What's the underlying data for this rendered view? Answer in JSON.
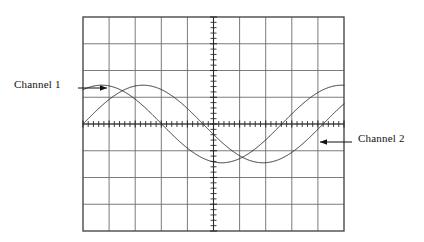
{
  "figure": {
    "kind": "oscilloscope-display",
    "background_color": "#ffffff"
  },
  "graticule": {
    "x": 83,
    "y": 17,
    "width": 261,
    "height": 214,
    "divisions_horizontal": 10,
    "divisions_vertical": 8,
    "subdivisions_per_division": 5,
    "grid_line_color": "#6d6d6d",
    "border_color": "#4a4a4a",
    "center_axis_color": "#2b2b2b",
    "tick_length_px": 6
  },
  "annotations": [
    {
      "id": "channel-1",
      "label": "Channel 1",
      "side": "left",
      "arrow_direction": "right",
      "text_x": 14,
      "text_y": 78,
      "leader_x1": 78,
      "leader_y1": 88,
      "leader_x2": 107,
      "leader_y2": 88,
      "color": "#111111"
    },
    {
      "id": "channel-2",
      "label": "Channel 2",
      "side": "right",
      "arrow_direction": "left",
      "text_x": 358,
      "text_y": 132,
      "leader_x1": 352,
      "leader_y1": 142,
      "leader_x2": 320,
      "leader_y2": 142,
      "color": "#111111"
    }
  ],
  "chart_data": {
    "type": "line",
    "title": "",
    "xlabel": "",
    "ylabel": "",
    "xlim": [
      0,
      10
    ],
    "ylim": [
      -4,
      4
    ],
    "grid": true,
    "legend": "annotated-arrows",
    "x_unit": "division",
    "y_unit": "division",
    "series": [
      {
        "name": "Channel 1",
        "waveform": "sine",
        "amplitude_divisions": 1.45,
        "period_divisions": 9.2,
        "phase_degrees": 62,
        "offset_divisions": 0,
        "color": "#2b2b2b",
        "line_width": 1
      },
      {
        "name": "Channel 2",
        "waveform": "sine",
        "amplitude_divisions": 1.45,
        "period_divisions": 9.2,
        "phase_degrees": 0,
        "offset_divisions": 0,
        "color": "#2b2b2b",
        "line_width": 1
      }
    ]
  }
}
